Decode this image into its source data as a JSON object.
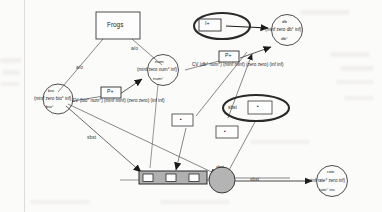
{
  "figure": {
    "type": "qualitative-causal-graph",
    "background": "#fbfbfa",
    "ink": "#2b2b2b"
  },
  "boxes": {
    "title": {
      "label": "Frogs"
    },
    "influence_top": {
      "label": "I+"
    },
    "prop_mid": {
      "label": "P+"
    },
    "prop_right": {
      "label": "P+"
    },
    "small_a": {
      "label": "▪"
    },
    "small_b": {
      "label": "▪"
    },
    "small_c": {
      "label": "▪"
    },
    "strip_1": {
      "label": "▫"
    },
    "strip_2": {
      "label": "▫"
    },
    "strip_3": {
      "label": "▫"
    }
  },
  "nodes": {
    "bio": {
      "name": "bio",
      "top_label": "bio",
      "interval": "(minf zero bio° inf)",
      "bottom_label": "bio°"
    },
    "num": {
      "name": "num",
      "top_label": "num",
      "interval": "(minf zero num° inf)",
      "bottom_label": "num°"
    },
    "db": {
      "name": "db",
      "top_label": "db",
      "interval": "(minf zero db° inf)",
      "bottom_label": "db°"
    },
    "rate": {
      "name": "rate",
      "top_label": "rate",
      "interval": "(minf rate° zero inf)",
      "bottom_label": "rate° inc"
    },
    "hub": {
      "name": "hub",
      "top_label": "sbst"
    }
  },
  "edge_labels": {
    "frogs_to_bio": "a/o",
    "frogs_to_num": "a/o",
    "bio_to_strip": "sbst",
    "hub_to_rate": "sbst"
  },
  "correspondences": {
    "cv_bio_num": "CV (bio° num°) (minf minf) (zero zero) (inf inf)",
    "cv_db_num": "CV (db° num°) (minf minf) (zero zero) (inf inf)"
  },
  "ellipses": {
    "top": {
      "label": ""
    },
    "sbst": {
      "label": "sbst"
    }
  }
}
